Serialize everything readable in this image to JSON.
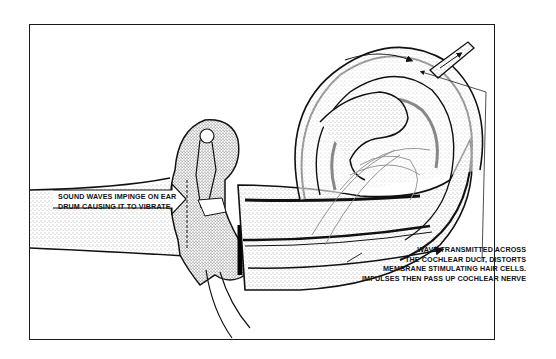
{
  "diagram": {
    "labels": {
      "sound_waves": {
        "lines": [
          "SOUND WAVES IMPINGE ON EAR",
          "DRUM CAUSING IT TO VIBRATE"
        ]
      },
      "wave_transmitted": {
        "lines": [
          "WAVE TRANSMITTED ACROSS",
          "THE COCHLEAR DUCT, DISTORTS",
          "MEMBRANE STIMULATING HAIR CELLS.",
          "IMPULSES THEN PASS UP COCHLEAR NERVE"
        ]
      }
    },
    "parts": [
      "ear-drum-arrow",
      "middle-ear-ossicles",
      "cochlea-spiral",
      "cochlear-nerve",
      "leader-line"
    ],
    "colors": {
      "ink": "#111111",
      "paper": "#ffffff",
      "stipple": "#8a8a8a"
    }
  }
}
